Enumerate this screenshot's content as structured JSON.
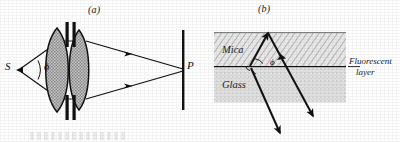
{
  "figure": {
    "type": "optics-ray-diagram",
    "panels": [
      {
        "id": "a",
        "label": "(a)",
        "description": "Source S emits a cone of rays of half-angle phi through a two-lens condenser with aperture stops, converging to point P on a screen.",
        "points": [
          {
            "name": "S",
            "label": "S",
            "role": "source"
          },
          {
            "name": "P",
            "label": "P",
            "role": "image-point"
          }
        ],
        "angle_label": "ϕ",
        "elements": [
          "source-point",
          "ray-cone",
          "lens-1",
          "lens-2",
          "aperture-stop-left",
          "aperture-stop-right",
          "screen"
        ]
      },
      {
        "id": "b",
        "label": "(b)",
        "description": "Ray in mica reflects at the fluorescent layer boundary with glass; angle phi at the interface; refracted ray continues into the glass.",
        "layers": [
          {
            "name": "mica",
            "label": "Mica",
            "fill": "diagonal-hatch"
          },
          {
            "name": "fluorescent-layer",
            "label": "Fluorescent layer",
            "fill": "line"
          },
          {
            "name": "glass",
            "label": "Glass",
            "fill": "stipple"
          }
        ],
        "angle_label": "ϕ",
        "callout": {
          "line1": "Fluorescent",
          "line2": "layer"
        }
      }
    ]
  },
  "colors": {
    "ink": "#111111",
    "lens_fill": "#b9b9b9",
    "mica_fill": "#d8d8d8",
    "glass_fill": "#dedede",
    "background": "#ffffff"
  }
}
